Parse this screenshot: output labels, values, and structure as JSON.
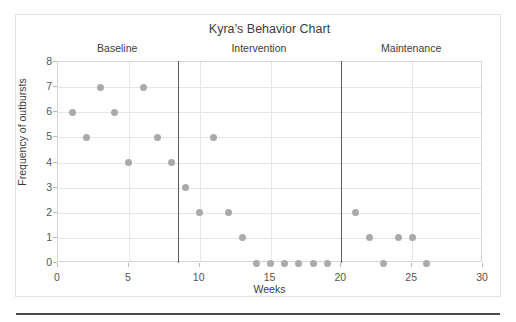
{
  "chart_data": {
    "type": "scatter",
    "title": "Kyra’s Behavior Chart",
    "xlabel": "Weeks",
    "ylabel": "Frequency of outbursts",
    "xlim": [
      0,
      30
    ],
    "ylim": [
      0,
      8
    ],
    "grid": true,
    "legend": "none",
    "xticks": [
      0,
      5,
      10,
      15,
      20,
      25,
      30
    ],
    "yticks": [
      0,
      1,
      2,
      3,
      4,
      5,
      6,
      7,
      8
    ],
    "x": [
      1,
      2,
      3,
      4,
      5,
      6,
      7,
      8,
      9,
      10,
      11,
      12,
      13,
      14,
      15,
      16,
      17,
      18,
      19,
      21,
      22,
      23,
      24,
      25,
      26
    ],
    "y": [
      6,
      5,
      7,
      6,
      4,
      7,
      5,
      4,
      3,
      2,
      5,
      2,
      1,
      0,
      0,
      0,
      0,
      0,
      0,
      2,
      1,
      0,
      1,
      1,
      0
    ],
    "points": [
      {
        "x": 1,
        "y": 6
      },
      {
        "x": 2,
        "y": 5
      },
      {
        "x": 3,
        "y": 7
      },
      {
        "x": 4,
        "y": 6
      },
      {
        "x": 5,
        "y": 4
      },
      {
        "x": 6,
        "y": 7
      },
      {
        "x": 7,
        "y": 5
      },
      {
        "x": 8,
        "y": 4
      },
      {
        "x": 9,
        "y": 3
      },
      {
        "x": 10,
        "y": 2
      },
      {
        "x": 11,
        "y": 5
      },
      {
        "x": 12,
        "y": 2
      },
      {
        "x": 13,
        "y": 1
      },
      {
        "x": 14,
        "y": 0
      },
      {
        "x": 15,
        "y": 0
      },
      {
        "x": 16,
        "y": 0
      },
      {
        "x": 17,
        "y": 0
      },
      {
        "x": 18,
        "y": 0
      },
      {
        "x": 19,
        "y": 0
      },
      {
        "x": 21,
        "y": 2
      },
      {
        "x": 22,
        "y": 1
      },
      {
        "x": 23,
        "y": 0
      },
      {
        "x": 24,
        "y": 1
      },
      {
        "x": 25,
        "y": 1
      },
      {
        "x": 26,
        "y": 0
      }
    ],
    "marker_color": "#aaaaaa",
    "phase_lines": [
      8.5,
      20
    ],
    "phase_line_color": "#5c5c5c",
    "phases": [
      {
        "label": "Baseline",
        "start": 0,
        "end": 8.5,
        "center": 4.25
      },
      {
        "label": "Intervention",
        "start": 8.5,
        "end": 20,
        "center": 14.25
      },
      {
        "label": "Maintenance",
        "start": 20,
        "end": 30,
        "center": 25
      }
    ]
  }
}
